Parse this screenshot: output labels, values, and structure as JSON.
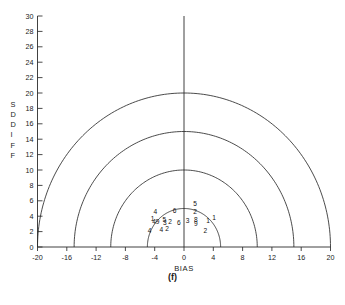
{
  "figure": {
    "caption": "(f)"
  },
  "chart_data": {
    "type": "scatter",
    "title": "",
    "xlabel": "BIAS",
    "ylabel": "SDDIFF",
    "ylabel_letters": [
      "S",
      "D",
      "D",
      "I",
      "F",
      "F"
    ],
    "xlim": [
      -20,
      20
    ],
    "ylim": [
      0,
      30
    ],
    "xticks": [
      -20,
      -16,
      -12,
      -8,
      -4,
      0,
      4,
      8,
      12,
      16,
      20
    ],
    "yticks": [
      0,
      2,
      4,
      6,
      8,
      10,
      12,
      14,
      16,
      18,
      20,
      22,
      24,
      26,
      28,
      30
    ],
    "xtick_labels": [
      "-20",
      "-16",
      "-12",
      "-8",
      "-4",
      "0",
      "4",
      "8",
      "12",
      "16",
      "20"
    ],
    "ytick_labels": [
      "0",
      "2",
      "4",
      "6",
      "8",
      "10",
      "12",
      "14",
      "16",
      "18",
      "20",
      "22",
      "24",
      "26",
      "28",
      "30"
    ],
    "grid": false,
    "legend": "none",
    "center_line_x": 0,
    "arcs": {
      "description": "concentric semicircles centered at origin",
      "radii": [
        5,
        10,
        15,
        20
      ],
      "color": "#2b2b2b"
    },
    "marker_style": "digit-labels",
    "points": [
      {
        "label": "4",
        "x": -4.7,
        "y": 2.1
      },
      {
        "label": "4",
        "x": -3.9,
        "y": 4.6
      },
      {
        "label": "1",
        "x": -4.3,
        "y": 3.7
      },
      {
        "label": "4",
        "x": -4.1,
        "y": 3.3
      },
      {
        "label": "9",
        "x": -3.6,
        "y": 3.3
      },
      {
        "label": "4",
        "x": -3.1,
        "y": 2.3
      },
      {
        "label": "5",
        "x": -2.7,
        "y": 3.5
      },
      {
        "label": "3",
        "x": -2.6,
        "y": 3.2
      },
      {
        "label": "2",
        "x": -2.3,
        "y": 2.4
      },
      {
        "label": "2",
        "x": -1.9,
        "y": 3.3
      },
      {
        "label": "6",
        "x": -1.3,
        "y": 4.7
      },
      {
        "label": "6",
        "x": -0.7,
        "y": 3.2
      },
      {
        "label": "3",
        "x": 0.5,
        "y": 3.4
      },
      {
        "label": "5",
        "x": 1.5,
        "y": 5.6
      },
      {
        "label": "2",
        "x": 1.5,
        "y": 4.6
      },
      {
        "label": "8",
        "x": 1.6,
        "y": 3.5
      },
      {
        "label": "9",
        "x": 1.6,
        "y": 3.1
      },
      {
        "label": "1",
        "x": 3.3,
        "y": 3.4
      },
      {
        "label": "1",
        "x": 4.1,
        "y": 3.8
      },
      {
        "label": "2",
        "x": 2.9,
        "y": 2.1
      }
    ],
    "colors": {
      "axis": "#2b2b2b",
      "arc": "#2b2b2b",
      "text": "#1a1a1a",
      "background": "#ffffff"
    }
  }
}
